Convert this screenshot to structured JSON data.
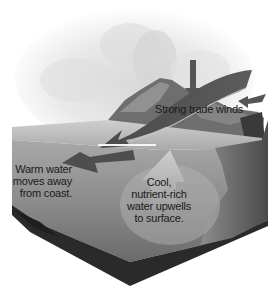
{
  "diagram": {
    "type": "ocean-upwelling-illustration",
    "labels": {
      "trade_winds": "Strong trade winds",
      "warm_water": "Warm water\nmoves away\nfrom coast.",
      "cool_water": "Cool,\nnutrient-rich\nwater upwells\nto surface."
    },
    "elements": [
      {
        "name": "clouds",
        "description": "Cloud-covered sky above a mountainous island"
      },
      {
        "name": "island",
        "description": "Mountainous coastline on the right"
      },
      {
        "name": "trade-wind-arrow",
        "description": "Large curved arrow sweeping from upper right to lower left"
      },
      {
        "name": "warm-water-arrow",
        "description": "Arrow pointing left, away from coast"
      },
      {
        "name": "upwelling-arrow",
        "description": "Lighter arrow rising toward surface"
      },
      {
        "name": "ocean-block",
        "description": "Cut-away cross-section of ocean water"
      }
    ],
    "colors": {
      "arrow": "#505050",
      "water_surface": "#b8b8b8",
      "water_body": "#8a8a8a",
      "seafloor": "#2c2c2c",
      "cloud": "#e6e6e6"
    }
  }
}
